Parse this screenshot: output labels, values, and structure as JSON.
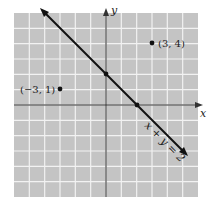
{
  "diagram": {
    "type": "coordinate-plane",
    "background_color": "#c4c4c4",
    "grid_color": "#f2f2f2",
    "axis_color": "#333333",
    "x_axis_label": "x",
    "y_axis_label": "y",
    "x_range": [
      -6,
      6
    ],
    "y_range": [
      -6,
      6
    ],
    "grid_step": 1
  },
  "line": {
    "equation_label": "x + y = 2",
    "from": [
      -4,
      6
    ],
    "to": [
      5,
      -3
    ],
    "intercepts": [
      [
        0,
        2
      ],
      [
        2,
        0
      ]
    ]
  },
  "points": [
    {
      "label": "(3, 4)",
      "x": 3,
      "y": 4
    },
    {
      "label": "(−3, 1)",
      "x": -3,
      "y": 1
    }
  ],
  "chart_data": {
    "type": "scatter",
    "title": "",
    "xlabel": "x",
    "ylabel": "y",
    "xlim": [
      -6,
      6
    ],
    "ylim": [
      -6,
      6
    ],
    "grid": true,
    "series": [
      {
        "name": "points",
        "x": [
          3,
          -3
        ],
        "y": [
          4,
          1
        ],
        "labels": [
          "(3, 4)",
          "(−3, 1)"
        ]
      },
      {
        "name": "x + y = 2",
        "type": "line",
        "x": [
          -4,
          0,
          2,
          5
        ],
        "y": [
          6,
          2,
          0,
          -3
        ]
      }
    ]
  }
}
